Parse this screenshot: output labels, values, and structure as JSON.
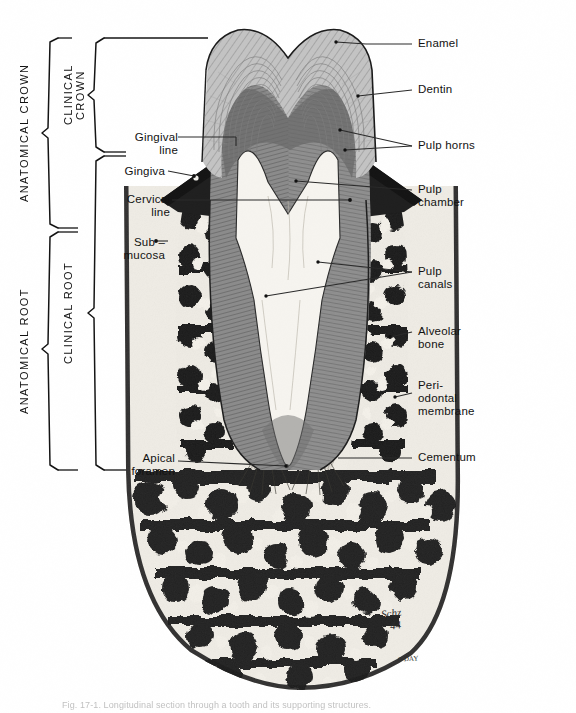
{
  "figure": {
    "caption": "Fig. 17-1. Longitudinal section through a tooth and its supporting structures.",
    "signature": "Schz",
    "signature_year": "44",
    "signature_small": "0-DAY"
  },
  "brackets": [
    {
      "id": "anatomical-crown",
      "label": "ANATOMICAL CROWN",
      "x": 28,
      "top": 38,
      "bottom": 228
    },
    {
      "id": "clinical-crown",
      "label": "CLINICAL\nCROWN",
      "x": 70,
      "top": 38,
      "bottom": 152
    },
    {
      "id": "anatomical-root",
      "label": "ANATOMICAL ROOT",
      "x": 28,
      "top": 228,
      "bottom": 470
    },
    {
      "id": "clinical-root",
      "label": "CLINICAL ROOT",
      "x": 70,
      "top": 152,
      "bottom": 470
    }
  ],
  "labels_left": [
    {
      "id": "gingival-line",
      "text": "Gingival\nline",
      "x": 118,
      "y": 131,
      "tx": 212,
      "ty": 146
    },
    {
      "id": "gingiva",
      "text": "Gingiva",
      "x": 118,
      "y": 168,
      "tx": 184,
      "ty": 172
    },
    {
      "id": "cervical-line",
      "text": "Cervical\nline",
      "x": 118,
      "y": 193,
      "tx": 230,
      "ty": 200
    },
    {
      "id": "sub-mucosa",
      "text": "Sub –\nmucosa",
      "x": 118,
      "y": 236,
      "tx": 156,
      "ty": 241
    },
    {
      "id": "apical-foramen",
      "text": "Apical\nforamen",
      "x": 118,
      "y": 452,
      "tx": 238,
      "ty": 461
    }
  ],
  "labels_right": [
    {
      "id": "enamel",
      "text": "Enamel",
      "x": 418,
      "y": 43,
      "tx": 336,
      "ty": 42
    },
    {
      "id": "dentin",
      "text": "Dentin",
      "x": 418,
      "y": 85,
      "tx": 358,
      "ty": 96
    },
    {
      "id": "pulp-horns",
      "text": "Pulp horns",
      "x": 418,
      "y": 141,
      "tx": 340,
      "ty": 132
    },
    {
      "id": "pulp-chamber",
      "text": "Pulp\nchamber",
      "x": 418,
      "y": 190,
      "tx": 296,
      "ty": 181
    },
    {
      "id": "pulp-canals",
      "text": "Pulp\ncanals",
      "x": 418,
      "y": 268,
      "tx": 266,
      "ty": 295
    },
    {
      "id": "alveolar-bone",
      "text": "Alveolar\nbone",
      "x": 418,
      "y": 327,
      "tx": 436,
      "ty": 337
    },
    {
      "id": "periodontal-membrane",
      "text": "Peri-\nodontal\nmembrane",
      "x": 418,
      "y": 381,
      "tx": 403,
      "ty": 397
    },
    {
      "id": "cementum",
      "text": "Cementum",
      "x": 418,
      "y": 454,
      "tx": 372,
      "ty": 457
    }
  ],
  "colors": {
    "ink": "#1a1a1a",
    "leader": "#2a2a2a",
    "enamel": "#b9b9b9",
    "dentin": "#8c8c8c",
    "pulp": "#f2f0ec",
    "bone_dark": "#232323",
    "bone_light": "#ece9e2",
    "gingiva": "#262626",
    "submucosa": "#e9e6df",
    "background": "#ffffff"
  }
}
